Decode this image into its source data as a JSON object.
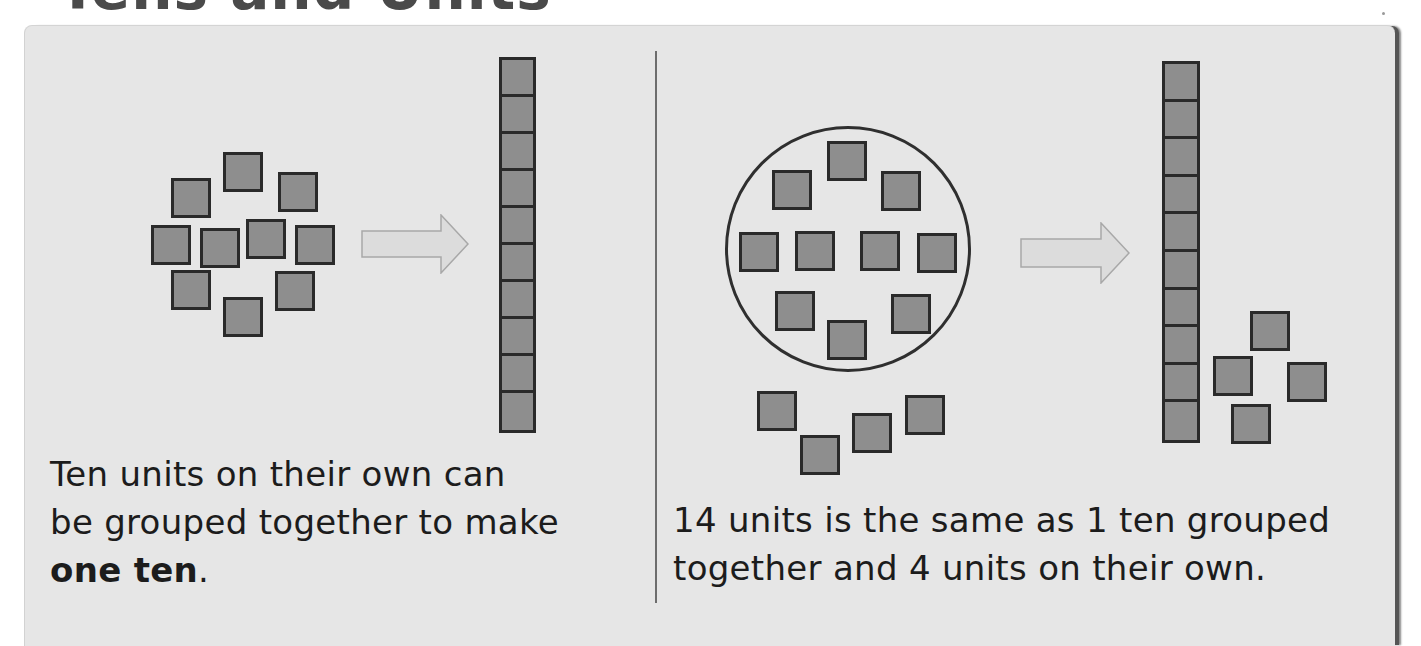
{
  "page": {
    "title": "Tens and Units"
  },
  "left_panel": {
    "caption_line1": "Ten units on their own can",
    "caption_line2": "be grouped together to make",
    "caption_bold": "one ten",
    "caption_end": ".",
    "loose_units": [
      {
        "x": 223,
        "y": 152
      },
      {
        "x": 171,
        "y": 178
      },
      {
        "x": 278,
        "y": 172
      },
      {
        "x": 151,
        "y": 225
      },
      {
        "x": 200,
        "y": 228
      },
      {
        "x": 246,
        "y": 219
      },
      {
        "x": 295,
        "y": 225
      },
      {
        "x": 171,
        "y": 270
      },
      {
        "x": 275,
        "y": 271
      },
      {
        "x": 223,
        "y": 297
      }
    ],
    "arrow": {
      "x": 361,
      "y": 214,
      "width": 108,
      "height": 60
    },
    "ten_rod": {
      "x": 499,
      "y": 57,
      "width": 37,
      "height": 376,
      "cells": 10
    },
    "illustration_label": "10 units grouped into one ten"
  },
  "right_panel": {
    "caption_line1": "14 units is the same as 1 ten grouped",
    "caption_line2": "together and 4 units on their own.",
    "group_circle": {
      "x": 725,
      "y": 126,
      "diameter": 246
    },
    "circled_units": [
      {
        "x": 827,
        "y": 141
      },
      {
        "x": 772,
        "y": 170
      },
      {
        "x": 881,
        "y": 171
      },
      {
        "x": 739,
        "y": 232
      },
      {
        "x": 795,
        "y": 231
      },
      {
        "x": 860,
        "y": 231
      },
      {
        "x": 917,
        "y": 233
      },
      {
        "x": 775,
        "y": 291
      },
      {
        "x": 891,
        "y": 294
      },
      {
        "x": 827,
        "y": 320
      }
    ],
    "loose_units": [
      {
        "x": 757,
        "y": 391
      },
      {
        "x": 800,
        "y": 435
      },
      {
        "x": 852,
        "y": 413
      },
      {
        "x": 905,
        "y": 395
      }
    ],
    "arrow": {
      "x": 1020,
      "y": 222,
      "width": 110,
      "height": 62
    },
    "ten_rod": {
      "x": 1162,
      "y": 61,
      "width": 38,
      "height": 382,
      "cells": 10
    },
    "ones_units": [
      {
        "x": 1250,
        "y": 311
      },
      {
        "x": 1213,
        "y": 356
      },
      {
        "x": 1287,
        "y": 362
      },
      {
        "x": 1231,
        "y": 404
      }
    ],
    "illustration_label": "14 units = 1 ten + 4 units"
  },
  "colors": {
    "panel_bg": "#e6e6e6",
    "unit_fill": "#8e8e8e",
    "unit_border": "#2a2a2a",
    "arrow_fill": "#dcdcdc",
    "arrow_stroke": "#a8a8a8",
    "text": "#1c1c1c"
  }
}
